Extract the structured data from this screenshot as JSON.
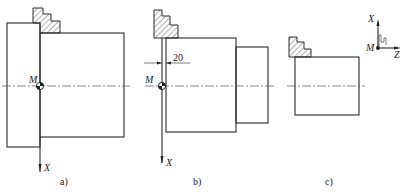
{
  "figure": {
    "panels": [
      {
        "id": "a",
        "caption": "a)",
        "origin_label": "M",
        "axis_label": "X"
      },
      {
        "id": "b",
        "caption": "b)",
        "origin_label": "M",
        "axis_label": "X",
        "dimension": "20"
      },
      {
        "id": "c",
        "caption": "c)",
        "origin_label": "M",
        "axis_x_label": "X",
        "axis_z_label": "Z"
      }
    ]
  }
}
